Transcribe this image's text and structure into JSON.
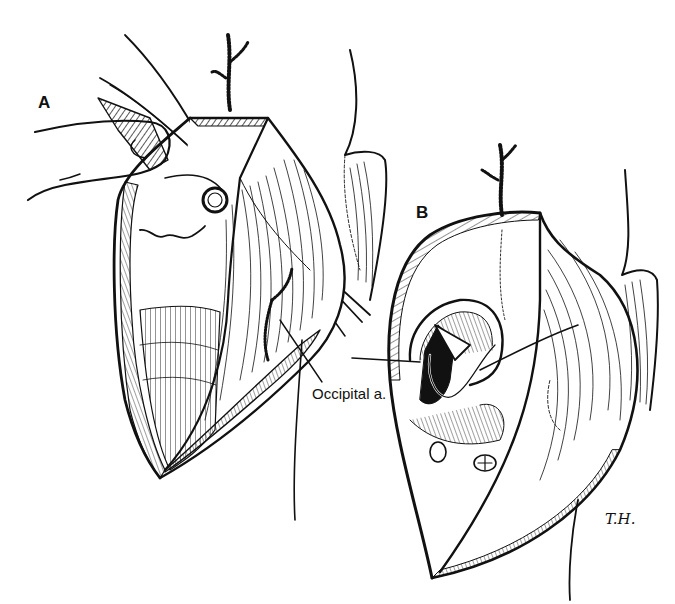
{
  "figure": {
    "type": "surgical illustration (line drawing)",
    "panels": [
      {
        "id": "A",
        "label": "A",
        "callouts": [
          {
            "text": "Occipital a."
          }
        ]
      },
      {
        "id": "B",
        "label": "B",
        "callouts": []
      }
    ],
    "signature": "T.H.",
    "colors": {
      "ink": "#111111",
      "background": "#ffffff"
    }
  }
}
